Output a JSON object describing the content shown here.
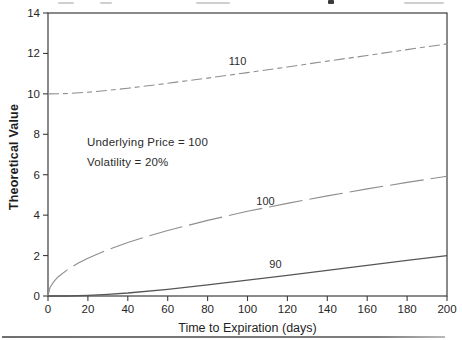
{
  "chart_data": {
    "type": "line",
    "title": "",
    "xlabel": "Time to Expiration (days)",
    "ylabel": "Theoretical Value",
    "xlim": [
      0,
      200
    ],
    "ylim": [
      0,
      14
    ],
    "xticks": [
      0,
      20,
      40,
      60,
      80,
      100,
      120,
      140,
      160,
      180,
      200
    ],
    "yticks": [
      0,
      2,
      4,
      6,
      8,
      10,
      12,
      14
    ],
    "grid": false,
    "legend": "inline-curve-labels",
    "annotations": [
      "Underlying Price = 100",
      "Volatility = 20%"
    ],
    "series": [
      {
        "name": "110",
        "line_style": "dash-dot",
        "color": "#8e8e8e",
        "label_at": {
          "x": 95,
          "y": 11.65
        },
        "x": [
          0,
          10,
          20,
          30,
          40,
          50,
          60,
          80,
          100,
          120,
          140,
          160,
          180,
          200
        ],
        "values": [
          10.0,
          10.02,
          10.08,
          10.17,
          10.28,
          10.4,
          10.52,
          10.78,
          11.05,
          11.33,
          11.62,
          11.9,
          12.19,
          12.47
        ]
      },
      {
        "name": "100",
        "line_style": "long-dash",
        "color": "#8e8e8e",
        "label_at": {
          "x": 109,
          "y": 4.72
        },
        "x": [
          0,
          1,
          3,
          5,
          10,
          15,
          20,
          30,
          40,
          50,
          60,
          80,
          100,
          120,
          140,
          160,
          180,
          200
        ],
        "values": [
          0,
          0.42,
          0.72,
          0.94,
          1.32,
          1.62,
          1.87,
          2.29,
          2.65,
          2.96,
          3.24,
          3.74,
          4.19,
          4.58,
          4.95,
          5.3,
          5.62,
          5.92
        ]
      },
      {
        "name": "90",
        "line_style": "solid",
        "color": "#565656",
        "label_at": {
          "x": 114,
          "y": 1.58
        },
        "x": [
          0,
          10,
          20,
          30,
          40,
          60,
          80,
          100,
          120,
          140,
          160,
          180,
          200
        ],
        "values": [
          0,
          0.0,
          0.03,
          0.08,
          0.15,
          0.33,
          0.55,
          0.78,
          1.02,
          1.27,
          1.52,
          1.76,
          2.0
        ]
      }
    ]
  }
}
